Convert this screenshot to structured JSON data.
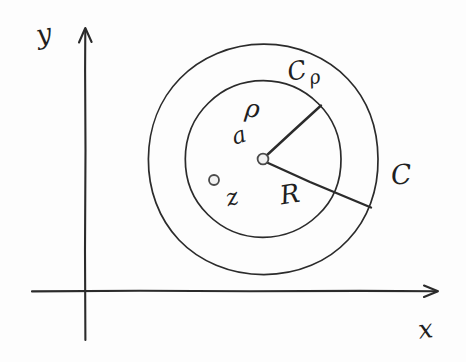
{
  "figure": {
    "kind": "hand-drawn-diagram",
    "ink_color": "#2b2b2b",
    "background_color": "#fdfdfd"
  },
  "axes": {
    "x_label": "x",
    "y_label": "y",
    "origin": {
      "x": 85,
      "y": 291
    },
    "x_axis": {
      "start_x": 32,
      "end_x": 440,
      "y": 291,
      "arrow": "right"
    },
    "y_axis": {
      "x": 85,
      "start_y": 340,
      "end_y": 28,
      "arrow": "up"
    }
  },
  "contours": {
    "outer": {
      "label": "C",
      "center": {
        "x": 263,
        "y": 159
      },
      "radius": 115
    },
    "inner": {
      "label": "C",
      "label_subscript": "ρ",
      "center": {
        "x": 263,
        "y": 159
      },
      "radius": 78
    }
  },
  "points": {
    "center": {
      "label": "a",
      "x": 263,
      "y": 159
    },
    "interior": {
      "label": "z",
      "x": 214,
      "y": 180
    }
  },
  "radii": {
    "inner_radius": {
      "label": "ρ",
      "from": {
        "x": 263,
        "y": 159
      },
      "to": {
        "x": 320,
        "y": 106
      }
    },
    "outer_radius": {
      "label": "R",
      "from": {
        "x": 263,
        "y": 159
      },
      "to": {
        "x": 370,
        "y": 207
      }
    }
  }
}
